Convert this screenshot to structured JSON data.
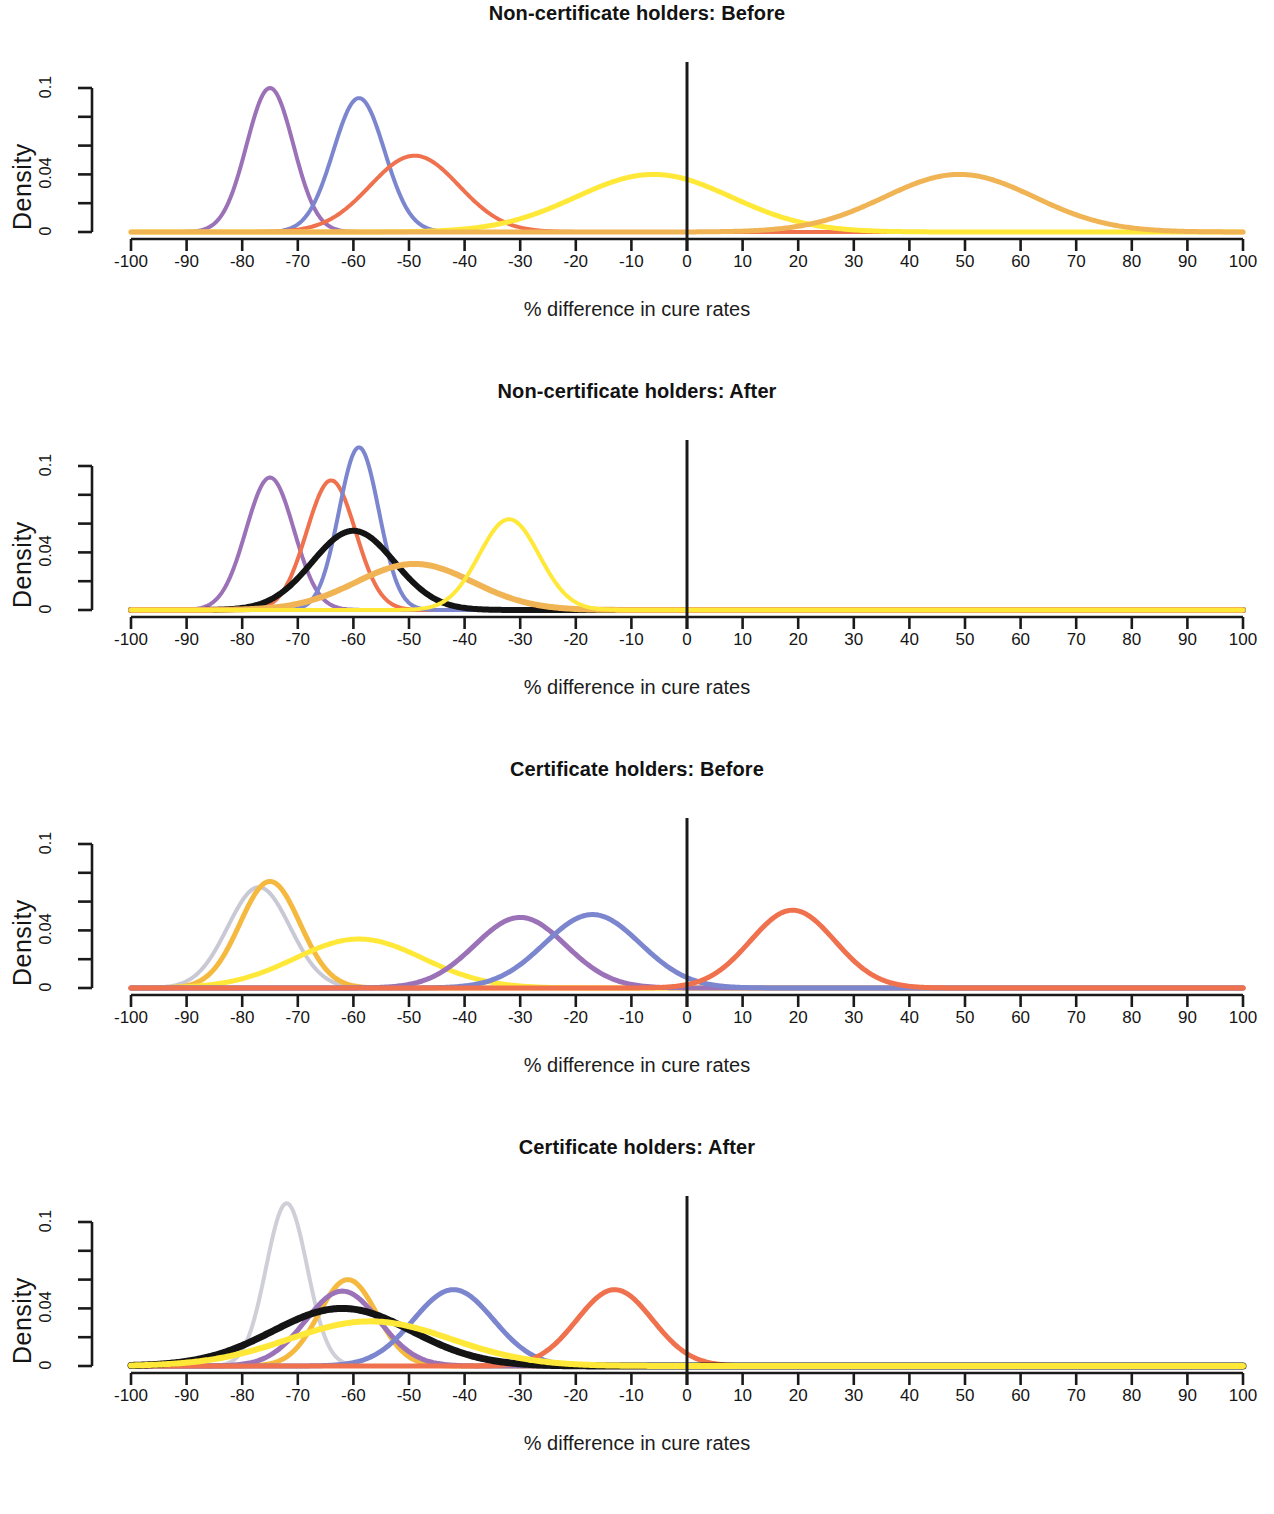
{
  "figure": {
    "panel_count": 4,
    "axis_title": "% difference in cure rates",
    "y_axis_label": "Density",
    "y_tick_labels": [
      "0",
      "0.04",
      "0.1"
    ],
    "x_tick_labels": [
      "-100",
      "-90",
      "-80",
      "-70",
      "-60",
      "-50",
      "-40",
      "-30",
      "-20",
      "-10",
      "0",
      "10",
      "20",
      "30",
      "40",
      "50",
      "60",
      "70",
      "80",
      "90",
      "100"
    ]
  },
  "chart_data": [
    {
      "type": "line",
      "title": "Non-certificate holders: Before",
      "xlabel": "% difference in cure rates",
      "ylabel": "Density",
      "xlim": [
        -100,
        100
      ],
      "ylim": [
        0,
        0.12
      ],
      "xticks": [
        -100,
        -90,
        -80,
        -70,
        -60,
        -50,
        -40,
        -30,
        -20,
        -10,
        0,
        10,
        20,
        30,
        40,
        50,
        60,
        70,
        80,
        90,
        100
      ],
      "yticks": [
        0,
        0.02,
        0.04,
        0.06,
        0.08,
        0.1
      ],
      "ytick_labels": {
        "0": "0",
        "0.04": "0.04",
        "0.1": "0.1"
      },
      "grid": false,
      "legend": "none",
      "annotations": [
        {
          "type": "vline",
          "x": 0,
          "color": "#1a1a1a",
          "label": "zero reference line"
        }
      ],
      "series": [
        {
          "name": "density-purple",
          "color": "#9b72b8",
          "mean": -75,
          "sd": 4.2,
          "peak": 0.1,
          "linewidth": 4
        },
        {
          "name": "density-blue",
          "color": "#7b86cf",
          "mean": -59,
          "sd": 4.6,
          "peak": 0.093,
          "linewidth": 4
        },
        {
          "name": "density-red",
          "color": "#f0714d",
          "mean": -49,
          "sd": 8.0,
          "peak": 0.053,
          "linewidth": 4
        },
        {
          "name": "density-yellow",
          "color": "#ffe838",
          "mean": -6,
          "sd": 14.0,
          "peak": 0.04,
          "linewidth": 5
        },
        {
          "name": "density-gold",
          "color": "#f0b455",
          "mean": 49,
          "sd": 13.5,
          "peak": 0.04,
          "linewidth": 5
        }
      ]
    },
    {
      "type": "line",
      "title": "Non-certificate holders: After",
      "xlabel": "% difference in cure rates",
      "ylabel": "Density",
      "xlim": [
        -100,
        100
      ],
      "ylim": [
        0,
        0.12
      ],
      "xticks": [
        -100,
        -90,
        -80,
        -70,
        -60,
        -50,
        -40,
        -30,
        -20,
        -10,
        0,
        10,
        20,
        30,
        40,
        50,
        60,
        70,
        80,
        90,
        100
      ],
      "yticks": [
        0,
        0.02,
        0.04,
        0.06,
        0.08,
        0.1
      ],
      "ytick_labels": {
        "0": "0",
        "0.04": "0.04",
        "0.1": "0.1"
      },
      "grid": false,
      "legend": "none",
      "annotations": [
        {
          "type": "vline",
          "x": 0,
          "color": "#1a1a1a",
          "label": "zero reference line"
        }
      ],
      "series": [
        {
          "name": "density-purple",
          "color": "#9b72b8",
          "mean": -75,
          "sd": 4.3,
          "peak": 0.092,
          "linewidth": 4
        },
        {
          "name": "density-red",
          "color": "#f0714d",
          "mean": -64,
          "sd": 4.4,
          "peak": 0.09,
          "linewidth": 4
        },
        {
          "name": "density-blue",
          "color": "#7b86cf",
          "mean": -59,
          "sd": 3.6,
          "peak": 0.113,
          "linewidth": 4
        },
        {
          "name": "density-black",
          "color": "#141414",
          "mean": -60,
          "sd": 7.4,
          "peak": 0.055,
          "linewidth": 6
        },
        {
          "name": "density-gold",
          "color": "#f0b455",
          "mean": -49,
          "sd": 10.5,
          "peak": 0.032,
          "linewidth": 6
        },
        {
          "name": "density-yellow",
          "color": "#ffe838",
          "mean": -32,
          "sd": 5.4,
          "peak": 0.063,
          "linewidth": 4
        }
      ]
    },
    {
      "type": "line",
      "title": "Certificate holders: Before",
      "xlabel": "% difference in cure rates",
      "ylabel": "Density",
      "xlim": [
        -100,
        100
      ],
      "ylim": [
        0,
        0.12
      ],
      "xticks": [
        -100,
        -90,
        -80,
        -70,
        -60,
        -50,
        -40,
        -30,
        -20,
        -10,
        0,
        10,
        20,
        30,
        40,
        50,
        60,
        70,
        80,
        90,
        100
      ],
      "yticks": [
        0,
        0.02,
        0.04,
        0.06,
        0.08,
        0.1
      ],
      "ytick_labels": {
        "0": "0",
        "0.04": "0.04",
        "0.1": "0.1"
      },
      "grid": false,
      "legend": "none",
      "annotations": [
        {
          "type": "vline",
          "x": 0,
          "color": "#1a1a1a",
          "label": "zero reference line"
        }
      ],
      "series": [
        {
          "name": "density-gray",
          "color": "#c9c9d6",
          "mean": -77,
          "sd": 5.6,
          "peak": 0.07,
          "linewidth": 4
        },
        {
          "name": "density-gold",
          "color": "#f5b93f",
          "mean": -75,
          "sd": 5.4,
          "peak": 0.074,
          "linewidth": 5
        },
        {
          "name": "density-yellow",
          "color": "#ffe838",
          "mean": -59,
          "sd": 11.5,
          "peak": 0.034,
          "linewidth": 5
        },
        {
          "name": "density-purple",
          "color": "#9b72b8",
          "mean": -30,
          "sd": 8.2,
          "peak": 0.049,
          "linewidth": 5
        },
        {
          "name": "density-blue",
          "color": "#7b86cf",
          "mean": -17,
          "sd": 8.6,
          "peak": 0.051,
          "linewidth": 5
        },
        {
          "name": "density-red",
          "color": "#f0714d",
          "mean": 19,
          "sd": 7.6,
          "peak": 0.054,
          "linewidth": 5
        }
      ]
    },
    {
      "type": "line",
      "title": "Certificate holders: After",
      "xlabel": "% difference in cure rates",
      "ylabel": "Density",
      "xlim": [
        -100,
        100
      ],
      "ylim": [
        0,
        0.12
      ],
      "xticks": [
        -100,
        -90,
        -80,
        -70,
        -60,
        -50,
        -40,
        -30,
        -20,
        -10,
        0,
        10,
        20,
        30,
        40,
        50,
        60,
        70,
        80,
        90,
        100
      ],
      "yticks": [
        0,
        0.02,
        0.04,
        0.06,
        0.08,
        0.1
      ],
      "ytick_labels": {
        "0": "0",
        "0.04": "0.04",
        "0.1": "0.1"
      },
      "grid": false,
      "legend": "none",
      "annotations": [
        {
          "type": "vline",
          "x": 0,
          "color": "#1a1a1a",
          "label": "zero reference line"
        }
      ],
      "series": [
        {
          "name": "density-gray",
          "color": "#cfcfd8",
          "mean": -72,
          "sd": 3.7,
          "peak": 0.113,
          "linewidth": 4
        },
        {
          "name": "density-gold",
          "color": "#f5b93f",
          "mean": -61,
          "sd": 5.2,
          "peak": 0.06,
          "linewidth": 5
        },
        {
          "name": "density-purple",
          "color": "#9b72b8",
          "mean": -62,
          "sd": 6.6,
          "peak": 0.052,
          "linewidth": 5
        },
        {
          "name": "density-blue",
          "color": "#7b86cf",
          "mean": -42,
          "sd": 7.2,
          "peak": 0.053,
          "linewidth": 5
        },
        {
          "name": "density-red",
          "color": "#f0714d",
          "mean": -13,
          "sd": 6.8,
          "peak": 0.053,
          "linewidth": 5
        },
        {
          "name": "density-black",
          "color": "#141414",
          "mean": -62,
          "sd": 12.5,
          "peak": 0.04,
          "linewidth": 7
        },
        {
          "name": "density-yellow",
          "color": "#ffe838",
          "mean": -57,
          "sd": 14.5,
          "peak": 0.031,
          "linewidth": 6
        }
      ]
    }
  ]
}
